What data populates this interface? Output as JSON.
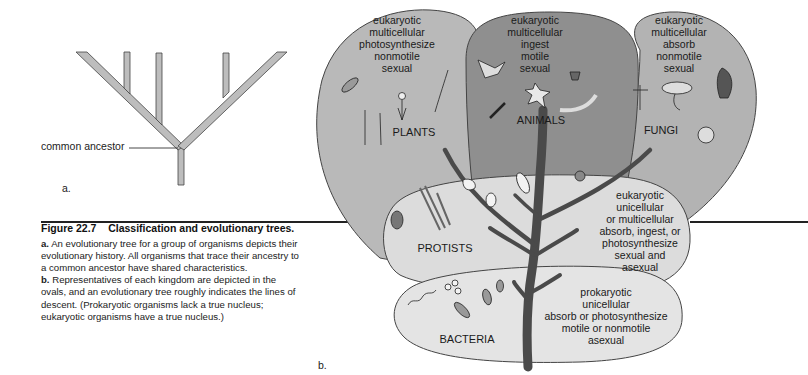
{
  "panel_a": {
    "letter": "a.",
    "ancestor_label": "common ancestor"
  },
  "panel_b": {
    "letter": "b.",
    "kingdoms": {
      "plants": {
        "name": "PLANTS",
        "traits": [
          "eukaryotic",
          "multicellular",
          "photosynthesize",
          "nonmotile",
          "sexual"
        ],
        "color": "#b9b9b9"
      },
      "animals": {
        "name": "ANIMALS",
        "traits": [
          "eukaryotic",
          "multicellular",
          "ingest",
          "motile",
          "sexual"
        ],
        "color": "#8f8f8f"
      },
      "fungi": {
        "name": "FUNGI",
        "traits": [
          "eukaryotic",
          "multicellular",
          "absorb",
          "nonmotile",
          "sexual"
        ],
        "color": "#b3b3b3"
      },
      "protists": {
        "name": "PROTISTS",
        "traits": [
          "eukaryotic",
          "unicellular",
          "or multicellular",
          "absorb, ingest, or",
          "photosynthesize",
          "sexual and",
          "asexual"
        ],
        "color": "#dcdcdc"
      },
      "bacteria": {
        "name": "BACTERIA",
        "traits": [
          "prokaryotic",
          "unicellular",
          "absorb or photosynthesize",
          "motile or nonmotile",
          "asexual"
        ],
        "color": "#e4e4e4"
      }
    },
    "trunk_color": "#4a4a4a"
  },
  "caption": {
    "figure_number": "Figure 22.7",
    "title": "Classification and evolutionary trees.",
    "part_a_label": "a.",
    "part_a_text": "An evolutionary tree for a group of organisms depicts their evolutionary history. All organisms that trace their ancestry to a common ancestor have shared characteristics.",
    "part_b_label": "b.",
    "part_b_text": "Representatives of each kingdom are depicted in the ovals, and an evolutionary tree roughly indicates the lines of descent. (Prokaryotic organisms lack a true nucleus; eukaryotic organisms have a true nucleus.)"
  }
}
